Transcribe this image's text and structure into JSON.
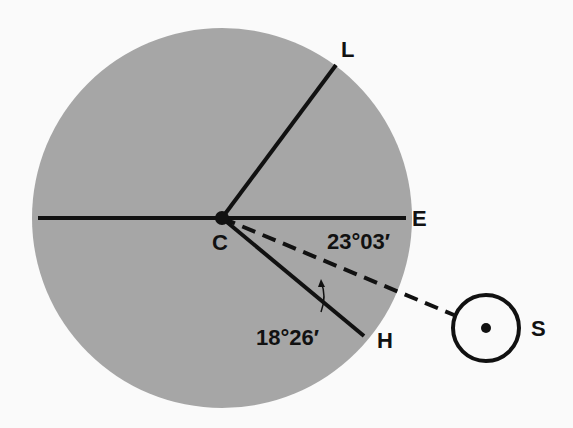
{
  "diagram": {
    "colors": {
      "background": "#fafafa",
      "disk": "#a6a6a6",
      "line": "#111111"
    },
    "points": {
      "center": "C",
      "zenith_line_end": "L",
      "equator_line_end": "E",
      "horizon_line_end": "H",
      "sun": "S"
    },
    "angles": {
      "equator_to_sun": "23°03′",
      "sun_to_horizon": "18°26′"
    }
  }
}
